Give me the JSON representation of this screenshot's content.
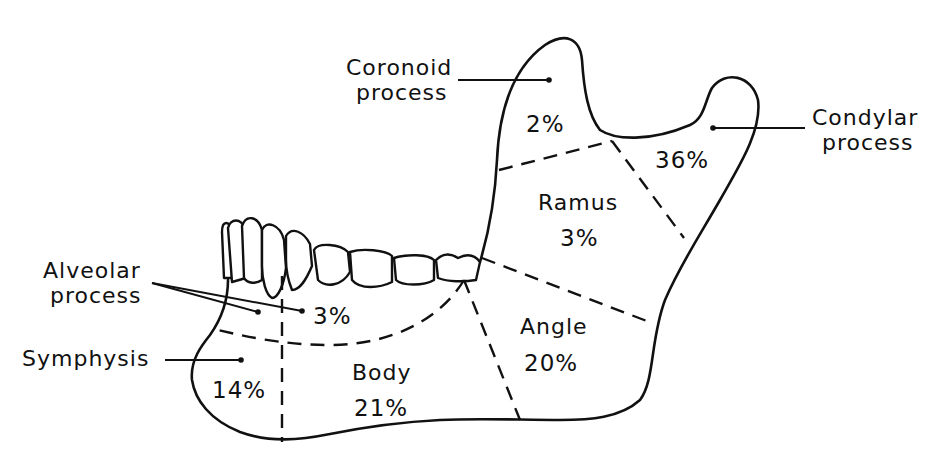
{
  "labels": {
    "coronoid": [
      "Coronoid",
      "process"
    ],
    "condylar": [
      "Condylar",
      "process"
    ],
    "alveolar": [
      "Alveolar",
      "process"
    ],
    "symphysis": "Symphysis"
  },
  "regions": [
    {
      "id": "coronoid",
      "name": "",
      "percent": "2%"
    },
    {
      "id": "condylar",
      "name": "",
      "percent": "36%"
    },
    {
      "id": "ramus",
      "name": "Ramus",
      "percent": "3%"
    },
    {
      "id": "angle",
      "name": "Angle",
      "percent": "20%"
    },
    {
      "id": "body",
      "name": "Body",
      "percent": "21%"
    },
    {
      "id": "alveolar",
      "name": "",
      "percent": "3%"
    },
    {
      "id": "symphysis",
      "name": "",
      "percent": "14%"
    }
  ]
}
